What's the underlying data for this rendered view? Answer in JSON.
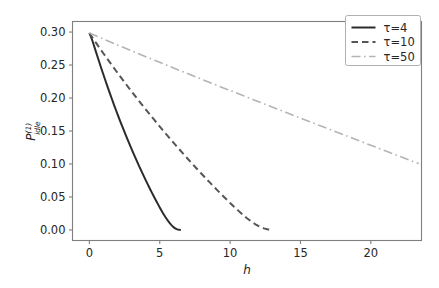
{
  "chart_data": {
    "type": "line",
    "title": "",
    "xlabel": "h",
    "ylabel": "P_idle^(1)",
    "ylabel_base": "P",
    "ylabel_sub": "idle",
    "ylabel_sup": "(1)",
    "xlim": [
      -1.2,
      23.6
    ],
    "ylim": [
      -0.016,
      0.316
    ],
    "xticks": [
      0,
      5,
      10,
      15,
      20
    ],
    "xticklabels": [
      "0",
      "5",
      "10",
      "15",
      "20"
    ],
    "yticks": [
      0.0,
      0.05,
      0.1,
      0.15,
      0.2,
      0.25,
      0.3
    ],
    "yticklabels": [
      "0.00",
      "0.05",
      "0.10",
      "0.15",
      "0.20",
      "0.25",
      "0.30"
    ],
    "grid": false,
    "legend_position": "upper right",
    "series": [
      {
        "name": "τ=4",
        "legend_label": "τ=4",
        "tau": 4,
        "color": "#2b2b2b",
        "linestyle": "solid",
        "dasharray": "",
        "linewidth": 2.0,
        "points": [
          [
            0.0,
            0.2985
          ],
          [
            0.12,
            0.2925
          ],
          [
            0.25,
            0.2845
          ],
          [
            0.4,
            0.2745
          ],
          [
            0.55,
            0.2645
          ],
          [
            0.7,
            0.2545
          ],
          [
            0.85,
            0.2448
          ],
          [
            1.0,
            0.2352
          ],
          [
            1.15,
            0.2258
          ],
          [
            1.3,
            0.2165
          ],
          [
            1.45,
            0.2074
          ],
          [
            1.6,
            0.1985
          ],
          [
            1.75,
            0.1897
          ],
          [
            1.9,
            0.1811
          ],
          [
            2.05,
            0.1726
          ],
          [
            2.2,
            0.1643
          ],
          [
            2.35,
            0.1562
          ],
          [
            2.5,
            0.1482
          ],
          [
            2.65,
            0.1403
          ],
          [
            2.8,
            0.1326
          ],
          [
            2.95,
            0.1251
          ],
          [
            3.1,
            0.1176
          ],
          [
            3.25,
            0.1103
          ],
          [
            3.4,
            0.1031
          ],
          [
            3.55,
            0.0961
          ],
          [
            3.7,
            0.0891
          ],
          [
            3.85,
            0.0823
          ],
          [
            4.0,
            0.0756
          ],
          [
            4.15,
            0.069
          ],
          [
            4.3,
            0.0625
          ],
          [
            4.45,
            0.0562
          ],
          [
            4.6,
            0.05
          ],
          [
            4.75,
            0.0439
          ],
          [
            4.9,
            0.038
          ],
          [
            5.0,
            0.0341
          ],
          [
            5.1,
            0.0303
          ],
          [
            5.2,
            0.0266
          ],
          [
            5.3,
            0.0231
          ],
          [
            5.4,
            0.0197
          ],
          [
            5.5,
            0.0165
          ],
          [
            5.6,
            0.0135
          ],
          [
            5.7,
            0.0107
          ],
          [
            5.8,
            0.0081
          ],
          [
            5.9,
            0.0058
          ],
          [
            6.0,
            0.0038
          ],
          [
            6.1,
            0.0023
          ],
          [
            6.2,
            0.0012
          ],
          [
            6.3,
            0.0005
          ],
          [
            6.4,
            0.0002
          ],
          [
            6.5,
            0.0001
          ]
        ]
      },
      {
        "name": "τ=10",
        "legend_label": "τ=10",
        "tau": 10,
        "color": "#555555",
        "linestyle": "dashed",
        "dasharray": "6.5,4",
        "linewidth": 2.0,
        "points": [
          [
            0.0,
            0.2985
          ],
          [
            0.25,
            0.2906
          ],
          [
            0.5,
            0.2828
          ],
          [
            0.75,
            0.2751
          ],
          [
            1.0,
            0.2675
          ],
          [
            1.3,
            0.2585
          ],
          [
            1.6,
            0.2497
          ],
          [
            1.9,
            0.241
          ],
          [
            2.2,
            0.2324
          ],
          [
            2.5,
            0.2239
          ],
          [
            2.8,
            0.2155
          ],
          [
            3.1,
            0.2072
          ],
          [
            3.4,
            0.199
          ],
          [
            3.7,
            0.1909
          ],
          [
            4.0,
            0.1829
          ],
          [
            4.3,
            0.175
          ],
          [
            4.6,
            0.1671
          ],
          [
            4.9,
            0.1594
          ],
          [
            5.2,
            0.1517
          ],
          [
            5.5,
            0.1442
          ],
          [
            5.8,
            0.1367
          ],
          [
            6.1,
            0.1293
          ],
          [
            6.4,
            0.122
          ],
          [
            6.7,
            0.1148
          ],
          [
            7.0,
            0.1076
          ],
          [
            7.3,
            0.1006
          ],
          [
            7.6,
            0.0936
          ],
          [
            7.9,
            0.0867
          ],
          [
            8.2,
            0.0799
          ],
          [
            8.5,
            0.0732
          ],
          [
            8.8,
            0.0665
          ],
          [
            9.1,
            0.06
          ],
          [
            9.4,
            0.0535
          ],
          [
            9.7,
            0.0472
          ],
          [
            10.0,
            0.0409
          ],
          [
            10.3,
            0.0348
          ],
          [
            10.6,
            0.0289
          ],
          [
            10.9,
            0.0232
          ],
          [
            11.2,
            0.0178
          ],
          [
            11.5,
            0.0129
          ],
          [
            11.8,
            0.0086
          ],
          [
            12.1,
            0.005
          ],
          [
            12.4,
            0.0024
          ],
          [
            12.7,
            0.0008
          ],
          [
            13.0,
            0.0002
          ]
        ]
      },
      {
        "name": "τ=50",
        "legend_label": "τ=50",
        "tau": 50,
        "color": "#b4b4b4",
        "linestyle": "dashdot",
        "dasharray": "9,3.5,1.6,3.5",
        "linewidth": 1.6,
        "points": [
          [
            0.0,
            0.2985
          ],
          [
            0.5,
            0.2939
          ],
          [
            1.0,
            0.2894
          ],
          [
            1.5,
            0.2849
          ],
          [
            2.0,
            0.2804
          ],
          [
            2.6,
            0.2751
          ],
          [
            3.2,
            0.2698
          ],
          [
            3.8,
            0.2645
          ],
          [
            4.4,
            0.2593
          ],
          [
            5.0,
            0.2541
          ],
          [
            5.6,
            0.2489
          ],
          [
            6.2,
            0.2437
          ],
          [
            6.8,
            0.2386
          ],
          [
            7.4,
            0.2334
          ],
          [
            8.0,
            0.2283
          ],
          [
            8.6,
            0.2232
          ],
          [
            9.2,
            0.2181
          ],
          [
            9.8,
            0.2131
          ],
          [
            10.4,
            0.208
          ],
          [
            11.0,
            0.203
          ],
          [
            11.6,
            0.1979
          ],
          [
            12.2,
            0.1929
          ],
          [
            12.8,
            0.1879
          ],
          [
            13.4,
            0.1829
          ],
          [
            14.0,
            0.1779
          ],
          [
            14.6,
            0.1729
          ],
          [
            15.2,
            0.1679
          ],
          [
            15.8,
            0.163
          ],
          [
            16.4,
            0.158
          ],
          [
            17.0,
            0.1531
          ],
          [
            17.6,
            0.1481
          ],
          [
            18.2,
            0.1432
          ],
          [
            18.8,
            0.1383
          ],
          [
            19.4,
            0.1333
          ],
          [
            20.0,
            0.1284
          ],
          [
            20.6,
            0.1235
          ],
          [
            21.2,
            0.1186
          ],
          [
            21.8,
            0.1137
          ],
          [
            22.4,
            0.1088
          ],
          [
            23.0,
            0.1039
          ],
          [
            23.4,
            0.1006
          ]
        ]
      }
    ]
  }
}
